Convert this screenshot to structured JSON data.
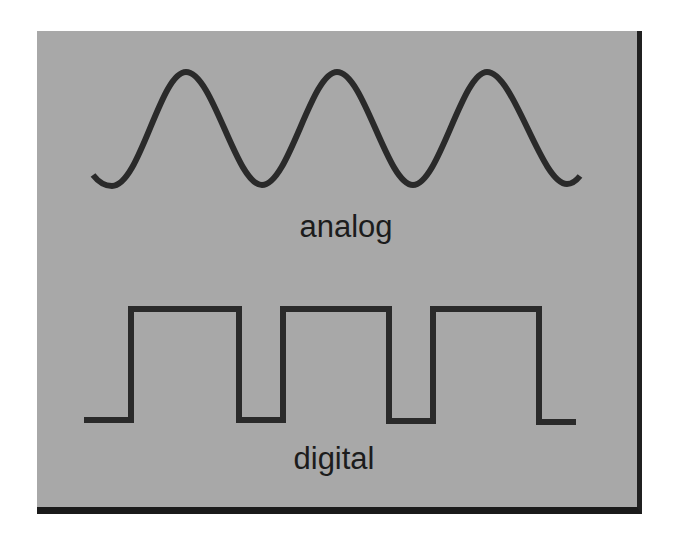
{
  "diagram": {
    "background_color": "#a8a8a8",
    "line_color": "#2a2a2a",
    "shadow_color": "#1e1e1e",
    "analog": {
      "label": "analog",
      "wave_type": "sine",
      "peaks_x": [
        186,
        337,
        487
      ],
      "troughs_x": [
        112,
        262,
        413,
        567
      ],
      "peak_y": 72,
      "trough_y": 184
    },
    "digital": {
      "label": "digital",
      "wave_type": "square",
      "high_y": 309,
      "low_y": 420,
      "transitions_x": [
        131,
        239,
        283,
        389,
        433,
        539
      ],
      "start_x": 84,
      "end_x": 576
    }
  }
}
